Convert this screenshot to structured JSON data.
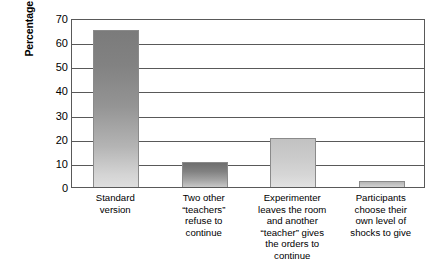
{
  "chart_data": {
    "type": "bar",
    "title": "",
    "xlabel": "",
    "ylabel": "Percentage giving the highest level of shock",
    "ylim": [
      0,
      70
    ],
    "ytick_values": [
      70,
      60,
      50,
      40,
      30,
      20,
      10,
      0
    ],
    "ytick_labels": [
      "70",
      "60",
      "50",
      "40",
      "30",
      "20",
      "10",
      "0"
    ],
    "grid": true,
    "legend": "none",
    "categories": [
      "Standard version",
      "Two other “teachers” refuse to continue",
      "Experimenter leaves the room and another “teacher” gives the orders to continue",
      "Participants choose their own level of shocks to give"
    ],
    "category_lines": [
      [
        "Standard",
        "version"
      ],
      [
        "Two other",
        "“teachers”",
        "refuse to",
        "continue"
      ],
      [
        "Experimenter",
        "leaves the room",
        "and another",
        "“teacher” gives",
        "the orders to",
        "continue"
      ],
      [
        "Participants",
        "choose their",
        "own level of",
        "shocks to give"
      ]
    ],
    "values": [
      65,
      10.5,
      20.5,
      2.5
    ],
    "bar_colors": [
      "#8a8a8a",
      "#7d7d7d",
      "#cfcfcf",
      "#c2c2c2"
    ],
    "axis_color": "#595959"
  }
}
